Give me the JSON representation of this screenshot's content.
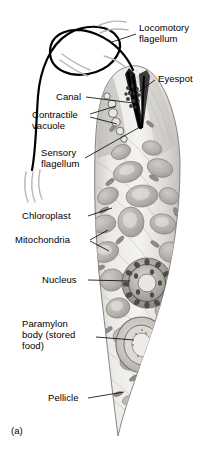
{
  "figure": {
    "panel_label": "(a)",
    "organism": "Euglena",
    "view": "longitudinal cutaway",
    "palette": {
      "background": "#ffffff",
      "cytoplasm_light": "#f2f0ed",
      "cytoplasm_mid": "#d9d6d1",
      "organelle_gray": "#b9b6b1",
      "organelle_dark": "#8d8a86",
      "outline": "#6f6d6a",
      "flagellum": "#000000",
      "leader_line": "#000000",
      "text": "#000000"
    }
  },
  "labels": [
    {
      "id": "locomotory-flagellum",
      "text": "Locomotory\nflagellum",
      "side": "right",
      "x": 139,
      "y": 23
    },
    {
      "id": "eyespot",
      "text": "Eyespot",
      "side": "right",
      "x": 158,
      "y": 74
    },
    {
      "id": "canal",
      "text": "Canal",
      "side": "left",
      "x": 56,
      "y": 92
    },
    {
      "id": "contractile-vacuole",
      "text": "Contractile\nvacuole",
      "side": "left",
      "x": 32,
      "y": 110
    },
    {
      "id": "sensory-flagellum",
      "text": "Sensory\nflagellum",
      "side": "left",
      "x": 41,
      "y": 148
    },
    {
      "id": "chloroplast",
      "text": "Chloroplast",
      "side": "left",
      "x": 22,
      "y": 211
    },
    {
      "id": "mitochondria",
      "text": "Mitochondria",
      "side": "left",
      "x": 15,
      "y": 235
    },
    {
      "id": "nucleus",
      "text": "Nucleus",
      "side": "left",
      "x": 42,
      "y": 275
    },
    {
      "id": "paramylon-body",
      "text": "Paramylon\nbody (stored\nfood)",
      "side": "left",
      "x": 22,
      "y": 319
    },
    {
      "id": "pellicle",
      "text": "Pellicle",
      "side": "left",
      "x": 48,
      "y": 393
    }
  ],
  "structures": [
    {
      "id": "locomotory-flagellum",
      "description": "long looping anterior flagellum"
    },
    {
      "id": "sensory-flagellum",
      "description": "short flagellum inside reservoir"
    },
    {
      "id": "eyespot",
      "description": "cluster of dark pigment granules near anterior"
    },
    {
      "id": "canal",
      "description": "dark funnel-shaped reservoir opening at anterior"
    },
    {
      "id": "contractile-vacuole",
      "description": "chain of small round vacuoles beside canal"
    },
    {
      "id": "chloroplast",
      "description": "many gray lobed plastids through cytoplasm"
    },
    {
      "id": "mitochondria",
      "description": "small elongated rod organelles"
    },
    {
      "id": "nucleus",
      "description": "large granular ring with central nucleolus"
    },
    {
      "id": "paramylon-body",
      "description": "large concentric stored-food granule, posterior"
    },
    {
      "id": "pellicle",
      "description": "striated flexible outer covering"
    }
  ]
}
